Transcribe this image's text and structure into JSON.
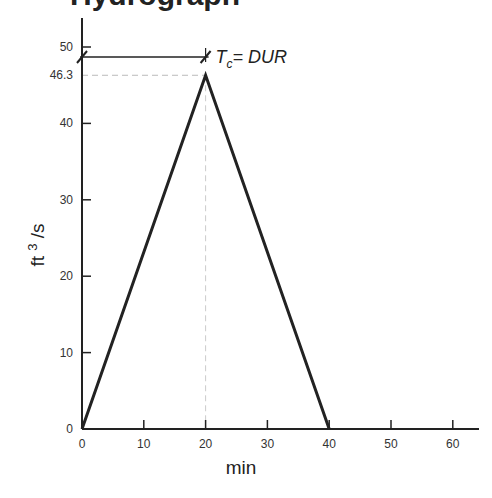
{
  "title": "Hydrograph",
  "chart_data": {
    "type": "line",
    "title": "Hydrograph",
    "xlabel": "min",
    "ylabel": "ft 3 /s",
    "xlim": [
      0,
      65
    ],
    "ylim": [
      0,
      53
    ],
    "xticks": [
      0,
      10,
      20,
      30,
      40,
      50,
      60
    ],
    "yticks": [
      0,
      10,
      20,
      30,
      40,
      50
    ],
    "extra_ytick_label": "46.3",
    "grid": false,
    "legend": null,
    "series": [
      {
        "name": "hydrograph",
        "x": [
          0,
          20,
          40
        ],
        "y": [
          0,
          46.3,
          0
        ]
      }
    ],
    "annotations": [
      {
        "text": "Tc = DUR",
        "main": "T",
        "subscript": "c",
        "rest": "= DUR",
        "type": "dimension-line",
        "from_x": 0,
        "to_x": 20
      },
      {
        "type": "dashed-guide",
        "description": "horizontal dashed line at peak 46.3"
      },
      {
        "type": "dashed-guide",
        "description": "vertical dashed line at x = 20"
      }
    ]
  }
}
